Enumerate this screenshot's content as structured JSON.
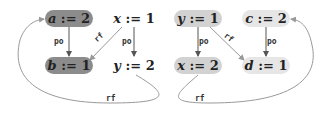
{
  "diagram": {
    "nodes": [
      {
        "id": "a2",
        "var": "a",
        "op": " := ",
        "val": "2",
        "x": 45,
        "y": 10,
        "w": 48,
        "bg": "#8c8c8c"
      },
      {
        "id": "x1",
        "var": "x",
        "op": " := ",
        "val": "1",
        "x": 110,
        "y": 10,
        "w": 48,
        "bg": "transparent"
      },
      {
        "id": "b1",
        "var": "b",
        "op": " := ",
        "val": "1",
        "x": 45,
        "y": 57,
        "w": 48,
        "bg": "#8c8c8c"
      },
      {
        "id": "y2",
        "var": "y",
        "op": " := ",
        "val": "2",
        "x": 110,
        "y": 57,
        "w": 48,
        "bg": "transparent"
      },
      {
        "id": "y1",
        "var": "y",
        "op": " := ",
        "val": "1",
        "x": 174,
        "y": 10,
        "w": 48,
        "bg": "#d2d2d2"
      },
      {
        "id": "c2",
        "var": "c",
        "op": " := ",
        "val": "2",
        "x": 242,
        "y": 10,
        "w": 48,
        "bg": "#e6e6e6"
      },
      {
        "id": "x2",
        "var": "x",
        "op": " := ",
        "val": "2",
        "x": 174,
        "y": 57,
        "w": 48,
        "bg": "#d2d2d2"
      },
      {
        "id": "d1",
        "var": "d",
        "op": " := ",
        "val": "1",
        "x": 242,
        "y": 57,
        "w": 48,
        "bg": "#e6e6e6"
      }
    ],
    "edge_labels": [
      {
        "text": "po",
        "x": 54,
        "y": 37
      },
      {
        "text": "rf",
        "x": 94,
        "y": 33,
        "rot": -42
      },
      {
        "text": "po",
        "x": 122,
        "y": 37
      },
      {
        "text": "po",
        "x": 199,
        "y": 37
      },
      {
        "text": "rf",
        "x": 224,
        "y": 33,
        "rot": 38
      },
      {
        "text": "po",
        "x": 267,
        "y": 37
      },
      {
        "text": "rf",
        "x": 106,
        "y": 94
      },
      {
        "text": "rf",
        "x": 195,
        "y": 94
      }
    ]
  }
}
